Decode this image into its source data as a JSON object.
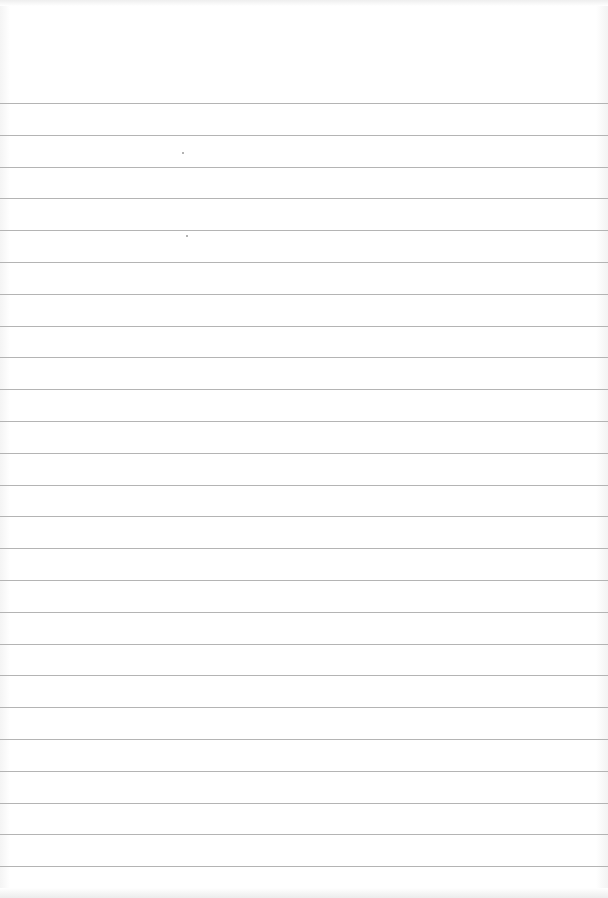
{
  "page": {
    "type": "ruled-paper",
    "background_color": "#ffffff",
    "rule_color": "#b4b4b4",
    "first_rule_y": 103,
    "rule_spacing": 31.8,
    "rule_count": 25,
    "lines": [
      "",
      "",
      "",
      "",
      "",
      "",
      "",
      "",
      "",
      "",
      "",
      "",
      "",
      "",
      "",
      "",
      "",
      "",
      "",
      "",
      "",
      "",
      "",
      "",
      ""
    ]
  }
}
